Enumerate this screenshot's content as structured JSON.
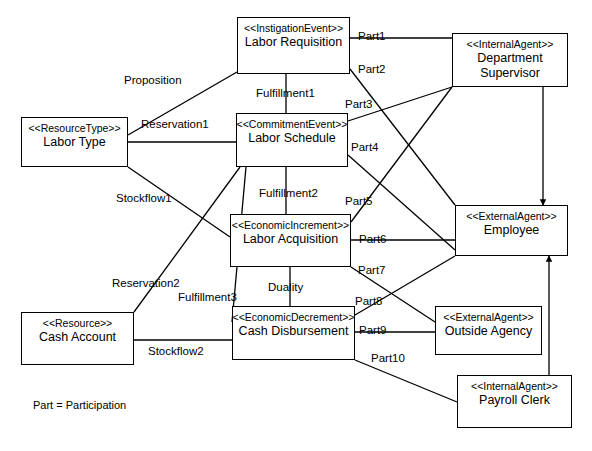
{
  "diagram": {
    "legend_note": "Part = Participation",
    "colors": {
      "stroke": "#000000",
      "background": "#ffffff"
    },
    "entities": [
      {
        "id": "labor-requisition",
        "stereotype": "<<InstigationEvent>>",
        "name": "Labor Requisition",
        "x": 237,
        "y": 17,
        "w": 113,
        "h": 57
      },
      {
        "id": "department-supervisor",
        "stereotype": "<<InternalAgent>>",
        "name": "Department Supervisor",
        "x": 452,
        "y": 33,
        "w": 116,
        "h": 54
      },
      {
        "id": "labor-type",
        "stereotype": "<<ResourceType>>",
        "name": "Labor Type",
        "x": 21,
        "y": 117,
        "w": 107,
        "h": 50
      },
      {
        "id": "labor-schedule",
        "stereotype": "<<CommitmentEvent>>",
        "name": "Labor Schedule",
        "x": 236,
        "y": 113,
        "w": 112,
        "h": 54
      },
      {
        "id": "labor-acquisition",
        "stereotype": "<<EconomicIncrement>>",
        "name": "Labor Acquisition",
        "x": 230,
        "y": 214,
        "w": 121,
        "h": 53
      },
      {
        "id": "employee",
        "stereotype": "<<ExternalAgent>>",
        "name": "Employee",
        "x": 455,
        "y": 205,
        "w": 113,
        "h": 51
      },
      {
        "id": "cash-account",
        "stereotype": "<<Resource>>",
        "name": "Cash Account",
        "x": 21,
        "y": 312,
        "w": 113,
        "h": 53
      },
      {
        "id": "cash-disbursement",
        "stereotype": "<<EconomicDecrement>>",
        "name": "Cash Disbursement",
        "x": 232,
        "y": 306,
        "w": 123,
        "h": 54
      },
      {
        "id": "outside-agency",
        "stereotype": "<<ExternalAgent>>",
        "name": "Outside Agency",
        "x": 435,
        "y": 306,
        "w": 107,
        "h": 49
      },
      {
        "id": "payroll-clerk",
        "stereotype": "<<InternalAgent>>",
        "name": "Payroll Clerk",
        "x": 457,
        "y": 375,
        "w": 115,
        "h": 53
      }
    ],
    "relationships": [
      {
        "id": "proposition",
        "label": "Proposition",
        "from": "labor-type",
        "to": "labor-requisition",
        "label_x": 124,
        "label_y": 74,
        "x1": 128,
        "y1": 135,
        "x2": 237,
        "y2": 72,
        "arrow": false
      },
      {
        "id": "reservation1",
        "label": "Reservation1",
        "from": "labor-type",
        "to": "labor-schedule",
        "label_x": 141,
        "label_y": 118,
        "x1": 128,
        "y1": 142,
        "x2": 236,
        "y2": 142,
        "arrow": false
      },
      {
        "id": "stockflow1",
        "label": "Stockflow1",
        "from": "labor-type",
        "to": "labor-acquisition",
        "label_x": 116,
        "label_y": 192,
        "x1": 128,
        "y1": 167,
        "x2": 230,
        "y2": 237,
        "arrow": false
      },
      {
        "id": "reservation2",
        "label": "Reservation2",
        "from": "cash-account",
        "to": "labor-schedule",
        "label_x": 112,
        "label_y": 277,
        "x1": 134,
        "y1": 312,
        "x2": 240,
        "y2": 167,
        "arrow": false
      },
      {
        "id": "stockflow2",
        "label": "Stockflow2",
        "from": "cash-account",
        "to": "cash-disbursement",
        "label_x": 148,
        "label_y": 345,
        "x1": 134,
        "y1": 340,
        "x2": 232,
        "y2": 340,
        "arrow": false
      },
      {
        "id": "fulfillment1",
        "label": "Fulfillment1",
        "from": "labor-requisition",
        "to": "labor-schedule",
        "label_x": 256,
        "label_y": 87,
        "x1": 286,
        "y1": 74,
        "x2": 286,
        "y2": 113,
        "arrow": false
      },
      {
        "id": "fulfillment2",
        "label": "Fulfillment2",
        "from": "labor-schedule",
        "to": "labor-acquisition",
        "label_x": 259,
        "label_y": 187,
        "x1": 286,
        "y1": 167,
        "x2": 286,
        "y2": 214,
        "arrow": false
      },
      {
        "id": "fulfillment3",
        "label": "Fulfillment3",
        "from": "labor-schedule",
        "to": "cash-disbursement",
        "label_x": 178,
        "label_y": 291,
        "x1": 246,
        "y1": 167,
        "x2": 232,
        "y2": 322,
        "arrow": false
      },
      {
        "id": "duality",
        "label": "Duality",
        "from": "labor-acquisition",
        "to": "cash-disbursement",
        "label_x": 268,
        "label_y": 281,
        "x1": 290,
        "y1": 267,
        "x2": 290,
        "y2": 306,
        "arrow": false
      },
      {
        "id": "part1",
        "label": "Part1",
        "from": "labor-requisition",
        "to": "department-supervisor",
        "label_x": 358,
        "label_y": 30,
        "x1": 350,
        "y1": 38,
        "x2": 452,
        "y2": 38,
        "arrow": false
      },
      {
        "id": "part2",
        "label": "Part2",
        "from": "labor-requisition",
        "to": "employee",
        "label_x": 358,
        "label_y": 63,
        "x1": 350,
        "y1": 69,
        "x2": 455,
        "y2": 205,
        "arrow": false
      },
      {
        "id": "part3",
        "label": "Part3",
        "from": "labor-schedule",
        "to": "department-supervisor",
        "label_x": 345,
        "label_y": 98,
        "x1": 348,
        "y1": 121,
        "x2": 452,
        "y2": 87,
        "arrow": false
      },
      {
        "id": "part4",
        "label": "Part4",
        "from": "labor-schedule",
        "to": "employee",
        "label_x": 351,
        "label_y": 141,
        "x1": 348,
        "y1": 155,
        "x2": 455,
        "y2": 250,
        "arrow": false
      },
      {
        "id": "part5",
        "label": "Part5",
        "from": "labor-acquisition",
        "to": "department-supervisor",
        "label_x": 345,
        "label_y": 195,
        "x1": 351,
        "y1": 222,
        "x2": 452,
        "y2": 87,
        "arrow": false
      },
      {
        "id": "part6",
        "label": "Part6",
        "from": "labor-acquisition",
        "to": "employee",
        "label_x": 359,
        "label_y": 233,
        "x1": 351,
        "y1": 240,
        "x2": 455,
        "y2": 240,
        "arrow": false
      },
      {
        "id": "part7",
        "label": "Part7",
        "from": "labor-acquisition",
        "to": "outside-agency",
        "label_x": 358,
        "label_y": 264,
        "x1": 351,
        "y1": 267,
        "x2": 435,
        "y2": 322,
        "arrow": false
      },
      {
        "id": "part8",
        "label": "Part8",
        "from": "cash-disbursement",
        "to": "employee",
        "label_x": 355,
        "label_y": 295,
        "x1": 355,
        "y1": 315,
        "x2": 455,
        "y2": 256,
        "arrow": false
      },
      {
        "id": "part9",
        "label": "Part9",
        "from": "cash-disbursement",
        "to": "outside-agency",
        "label_x": 359,
        "label_y": 324,
        "x1": 355,
        "y1": 332,
        "x2": 435,
        "y2": 332,
        "arrow": false
      },
      {
        "id": "part10",
        "label": "Part10",
        "from": "cash-disbursement",
        "to": "payroll-clerk",
        "label_x": 371,
        "label_y": 352,
        "x1": 355,
        "y1": 360,
        "x2": 457,
        "y2": 402,
        "arrow": false
      },
      {
        "id": "supervisor-to-employee",
        "label": "",
        "from": "department-supervisor",
        "to": "employee",
        "label_x": 0,
        "label_y": 0,
        "x1": 543,
        "y1": 87,
        "x2": 543,
        "y2": 205,
        "arrow": true
      },
      {
        "id": "payroll-to-employee",
        "label": "",
        "from": "payroll-clerk",
        "to": "employee",
        "label_x": 0,
        "label_y": 0,
        "x1": 549,
        "y1": 375,
        "x2": 549,
        "y2": 256,
        "arrow": true
      }
    ]
  }
}
